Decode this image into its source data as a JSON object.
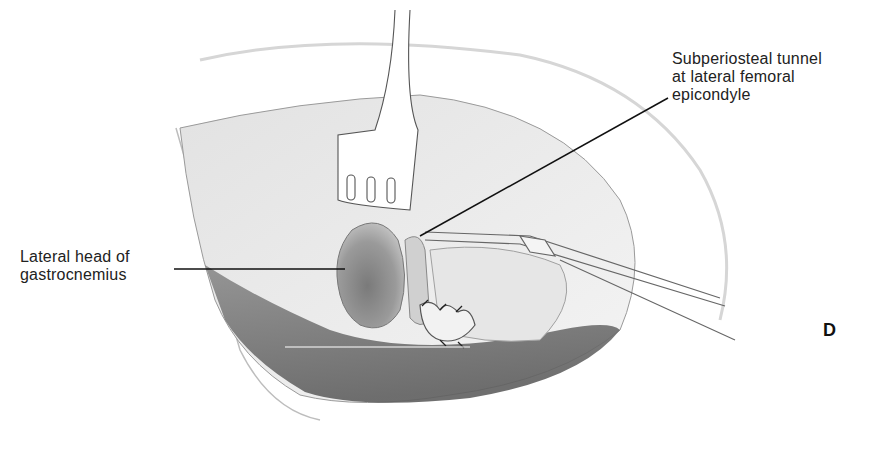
{
  "figure": {
    "panel_label": "D",
    "labels": [
      {
        "id": "lateral-head-gastrocnemius",
        "text": "Lateral head of\ngastrocnemius"
      },
      {
        "id": "subperiosteal-tunnel",
        "text": "Subperiosteal tunnel\nat lateral femoral\nepicondyle"
      }
    ],
    "colors": {
      "background": "#ffffff",
      "ink": "#111111",
      "tissue_dark": "#6e6e6e",
      "tissue_mid": "#a8a8a8",
      "tissue_light": "#d9d9d9"
    }
  }
}
